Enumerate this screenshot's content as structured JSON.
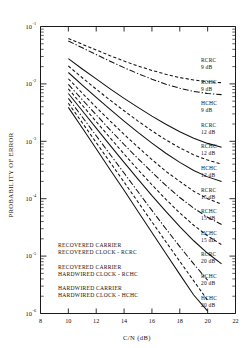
{
  "chart_data": {
    "type": "line",
    "title": "",
    "xlabel": "C/N (dB)",
    "ylabel": "PROBABILITY OF ERROR",
    "xlim": [
      8,
      22
    ],
    "ylim": [
      1e-06,
      0.1
    ],
    "yscale": "log",
    "grid": false,
    "legend_position": "inside-lower-left",
    "xticks": [
      "8",
      "10",
      "12",
      "14",
      "16",
      "18",
      "20",
      "22"
    ],
    "xtick_values": [
      8,
      10,
      12,
      14,
      16,
      18,
      20,
      22
    ],
    "ytick_labels": [
      "10-1",
      "10-2",
      "10-3",
      "10-4",
      "10-5",
      "10-6"
    ],
    "ytick_mantissa": "10",
    "ytick_exponents": [
      "-1",
      "-2",
      "-3",
      "-4",
      "-5",
      "-6"
    ],
    "ytick_values": [
      0.1,
      0.01,
      0.001,
      0.0001,
      1e-05,
      1e-06
    ],
    "series": [
      {
        "name": "RCRC 9 dB",
        "config": "RCRC",
        "cn": "9 dB",
        "style": "dashed",
        "label_lines": [
          "RCRC",
          "9 dB"
        ],
        "x": [
          10,
          11,
          12,
          13,
          14,
          15,
          16,
          17,
          18,
          19,
          20,
          21
        ],
        "y": [
          0.062,
          0.049,
          0.039,
          0.031,
          0.025,
          0.0205,
          0.0172,
          0.0147,
          0.0129,
          0.0117,
          0.0109,
          0.0105
        ]
      },
      {
        "name": "RCHC 9 dB",
        "config": "RCHC",
        "cn": "9 dB",
        "style": "dashdot",
        "label_lines": [
          "RCHC",
          "9 dB"
        ],
        "x": [
          10,
          11,
          12,
          13,
          14,
          15,
          16,
          17,
          18,
          19,
          20,
          21
        ],
        "y": [
          0.056,
          0.0425,
          0.0325,
          0.0248,
          0.0192,
          0.0151,
          0.0121,
          0.0099,
          0.0084,
          0.0074,
          0.0068,
          0.0065
        ]
      },
      {
        "name": "HCHC 9 dB",
        "config": "HCHC",
        "cn": "9 dB",
        "style": "solid",
        "label_lines": [
          "HCHC",
          "9 dB"
        ],
        "x": [
          10,
          11,
          12,
          13,
          14,
          15,
          16,
          17,
          18,
          19,
          20,
          21
        ],
        "y": [
          0.0275,
          0.0182,
          0.0122,
          0.0082,
          0.0056,
          0.0039,
          0.00275,
          0.00198,
          0.00147,
          0.00113,
          0.00092,
          0.00079
        ]
      },
      {
        "name": "RCRC 12 dB",
        "config": "RCRC",
        "cn": "12 dB",
        "style": "dashed",
        "label_lines": [
          "RCRC",
          "12 dB"
        ],
        "x": [
          10,
          11,
          12,
          13,
          14,
          15,
          16,
          17,
          18,
          19,
          20,
          21
        ],
        "y": [
          0.0205,
          0.0128,
          0.0081,
          0.0052,
          0.0034,
          0.00225,
          0.00152,
          0.00106,
          0.00077,
          0.00058,
          0.00047,
          0.0004
        ]
      },
      {
        "name": "RCHC 12 dB",
        "config": "RCHC",
        "cn": "12 dB",
        "style": "solid",
        "label_lines": [
          "RCHC",
          "12 dB"
        ],
        "x": [
          10,
          11,
          12,
          13,
          14,
          15,
          16,
          17,
          18,
          19,
          20,
          21
        ],
        "y": [
          0.0158,
          0.0095,
          0.0058,
          0.0036,
          0.00225,
          0.00143,
          0.00093,
          0.00062,
          0.00043,
          0.00031,
          0.00024,
          0.0002
        ]
      },
      {
        "name": "HCHC 12 dB",
        "config": "HCHC",
        "cn": "12 dB",
        "style": "dashed",
        "label_lines": [
          "HCHC",
          "12 dB"
        ],
        "x": [
          10,
          11,
          12,
          13,
          14,
          15,
          16,
          17,
          18,
          19,
          20,
          21
        ],
        "y": [
          0.0123,
          0.0069,
          0.0039,
          0.00225,
          0.00132,
          0.00079,
          0.00048,
          0.0003,
          0.0002,
          0.000135,
          0.0001,
          8e-05
        ]
      },
      {
        "name": "RCRC 15 dB",
        "config": "RCRC",
        "cn": "15 dB",
        "style": "dashdot",
        "label_lines": [
          "RCRC",
          "15 dB"
        ],
        "x": [
          10,
          11,
          12,
          13,
          14,
          15,
          16,
          17,
          18,
          19,
          20,
          21
        ],
        "y": [
          0.0098,
          0.0053,
          0.0029,
          0.00158,
          0.00088,
          0.0005,
          0.00029,
          0.00017,
          0.000105,
          6.85e-05,
          4.75e-05,
          3.55e-05
        ]
      },
      {
        "name": "RCHC 15 dB",
        "config": "RCHC",
        "cn": "15 dB",
        "style": "dashed",
        "label_lines": [
          "RCHC",
          "15 dB"
        ],
        "x": [
          10,
          11,
          12,
          13,
          14,
          15,
          16,
          17,
          18,
          19,
          20,
          21
        ],
        "y": [
          0.0082,
          0.00425,
          0.0022,
          0.00115,
          0.0006,
          0.00032,
          0.000175,
          9.75e-05,
          5.65e-05,
          3.45e-05,
          2.25e-05,
          1.58e-05
        ]
      },
      {
        "name": "HCHC 15 dB",
        "config": "HCHC",
        "cn": "15 dB",
        "style": "solid",
        "label_lines": [
          "HCHC",
          "15 dB"
        ],
        "x": [
          10,
          11,
          12,
          13,
          14,
          15,
          16,
          17,
          18,
          19,
          20,
          21
        ],
        "y": [
          0.0068,
          0.0034,
          0.0017,
          0.00085,
          0.00043,
          0.00022,
          0.000113,
          6e-05,
          3.25e-05,
          1.85e-05,
          1.12e-05,
          7.3e-06
        ]
      },
      {
        "name": "RCRC 20 dB",
        "config": "RCRC",
        "cn": "20 dB",
        "style": "dashdot",
        "label_lines": [
          "RCRC",
          "20 dB"
        ],
        "x": [
          10,
          11,
          12,
          13,
          14,
          15,
          16,
          17,
          18,
          19,
          20
        ],
        "y": [
          0.0056,
          0.00265,
          0.00125,
          0.00059,
          0.00028,
          0.000132,
          6.25e-05,
          3e-05,
          1.46e-05,
          7.3e-06,
          3.8e-06
        ]
      },
      {
        "name": "RCHC 20 dB",
        "config": "RCHC",
        "cn": "20 dB",
        "style": "dashed",
        "label_lines": [
          "RCHC",
          "20 dB"
        ],
        "x": [
          10,
          11,
          12,
          13,
          14,
          15,
          16,
          17,
          18,
          19,
          20
        ],
        "y": [
          0.0046,
          0.0021,
          0.00095,
          0.00043,
          0.000195,
          8.75e-05,
          3.95e-05,
          1.78e-05,
          8.1e-06,
          3.7e-06,
          1.7e-06
        ]
      },
      {
        "name": "HCHC 20 dB",
        "config": "HCHC",
        "cn": "20 dB",
        "style": "solid",
        "label_lines": [
          "HCHC",
          "20 dB"
        ],
        "x": [
          10,
          11,
          12,
          13,
          14,
          15,
          16,
          17,
          18,
          19,
          20
        ],
        "y": [
          0.0039,
          0.0017,
          0.00074,
          0.00032,
          0.00014,
          6e-05,
          2.58e-05,
          1.11e-05,
          4.8e-06,
          2.1e-06,
          1.1e-06
        ]
      }
    ],
    "annotations": [
      {
        "id": "legend-rcrc",
        "lines": [
          "RECOVERED CARRIER",
          "RECOVERED CLOCK - RCRC"
        ]
      },
      {
        "id": "legend-rchc",
        "lines": [
          "RECOVERED CARRIER",
          "HARDWIRED CLOCK - RCHC"
        ]
      },
      {
        "id": "legend-hchc",
        "lines": [
          "HARDWIRED CARRIER",
          "HARDWIRED CLOCK - HCHC"
        ]
      }
    ]
  }
}
